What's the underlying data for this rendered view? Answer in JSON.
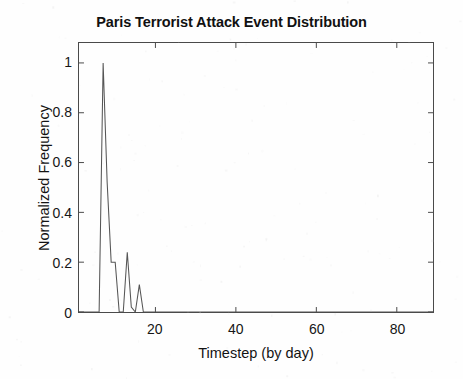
{
  "chart_data": {
    "type": "line",
    "title": "Paris Terrorist Attack Event Distribution",
    "xlabel": "Timestep (by day)",
    "ylabel": "Normalized Frequency",
    "xlim": [
      1,
      89
    ],
    "ylim": [
      0,
      1.08
    ],
    "grid": false,
    "legend": null,
    "xticks": [
      20,
      40,
      60,
      80
    ],
    "xtick_labels": [
      "20",
      "40",
      "60",
      "80"
    ],
    "yticks": [
      0,
      0.2,
      0.4,
      0.6,
      0.8,
      1
    ],
    "ytick_labels": [
      "0",
      "0.2",
      "0.4",
      "0.6",
      "0.8",
      "1"
    ],
    "series": [
      {
        "name": "Normalized Frequency",
        "color": "#555555",
        "x": [
          1,
          2,
          3,
          4,
          5,
          6,
          7,
          8,
          9,
          10,
          11,
          12,
          13,
          14,
          15,
          16,
          17,
          18,
          19,
          20,
          21,
          22,
          23,
          24,
          25,
          30,
          35,
          40,
          45,
          50,
          55,
          60,
          65,
          70,
          75,
          80,
          85,
          89
        ],
        "y": [
          0,
          0,
          0,
          0,
          0,
          0,
          1.0,
          0.52,
          0.2,
          0.2,
          0,
          0,
          0.24,
          0.02,
          0,
          0.11,
          0,
          0,
          0,
          0,
          0,
          0,
          0,
          0,
          0,
          0,
          0,
          0,
          0,
          0,
          0,
          0,
          0,
          0,
          0,
          0,
          0,
          0
        ]
      }
    ],
    "annotations": []
  },
  "axes": {
    "frame_color": "#4a4a4a",
    "tick_color": "#4a4a4a",
    "background": "#fefefe"
  }
}
